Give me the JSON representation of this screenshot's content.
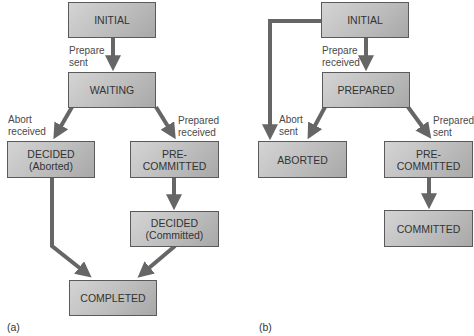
{
  "diagram_a": {
    "caption": "(a)",
    "states": {
      "initial": "INITIAL",
      "waiting": "WAITING",
      "decided_aborted_1": "DECIDED",
      "decided_aborted_2": "(Aborted)",
      "precommitted_1": "PRE-",
      "precommitted_2": "COMMITTED",
      "decided_committed_1": "DECIDED",
      "decided_committed_2": "(Committed)",
      "completed": "COMPLETED"
    },
    "transitions": {
      "prepare_sent": "Prepare\nsent",
      "abort_received": "Abort\nreceived",
      "prepared_received": "Prepared\nreceived"
    }
  },
  "diagram_b": {
    "caption": "(b)",
    "states": {
      "initial": "INITIAL",
      "prepared": "PREPARED",
      "aborted": "ABORTED",
      "precommitted_1": "PRE-",
      "precommitted_2": "COMMITTED",
      "committed": "COMMITTED"
    },
    "transitions": {
      "prepare_received": "Prepare\nreceived",
      "abort_sent": "Abort\nsent",
      "prepared_sent": "Prepared\nsent"
    }
  },
  "colors": {
    "box_fill": "#bdbdbd",
    "arrow": "#666666",
    "border": "#5a5a5a"
  }
}
